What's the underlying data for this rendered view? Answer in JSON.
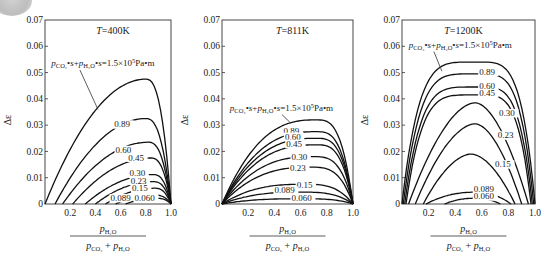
{
  "chart_data": [
    {
      "type": "line",
      "title": "T=400K",
      "xlabel": "p_H2O / (p_CO2 + p_H2O)",
      "ylabel": "Δε",
      "xlim": [
        0,
        1.0
      ],
      "ylim": [
        0,
        0.07
      ],
      "xticks": [
        "0.2",
        "0.4",
        "0.6",
        "0.8",
        "1.0"
      ],
      "yticks": [
        "0",
        "0.01",
        "0.02",
        "0.03",
        "0.04",
        "0.05",
        "0.06",
        "0.07"
      ],
      "annotation": "p_CO2·s + p_H2O·s = 1.5×10^5 Pa·m",
      "annotation_anchor": [
        0.42,
        0.036
      ],
      "annotation_text_pos": [
        0.05,
        0.0525
      ],
      "series": [
        {
          "name": "1.5",
          "label": "",
          "x0": 0.0,
          "xpk": 0.8,
          "ypk": 0.0475,
          "shape": "skew"
        },
        {
          "name": "0.89",
          "label": "0.89",
          "x0": 0.08,
          "xpk": 0.8,
          "ypk": 0.0325,
          "shape": "skew",
          "lx": 0.55,
          "ly": 0.0292
        },
        {
          "name": "0.60",
          "label": "0.60",
          "x0": 0.14,
          "xpk": 0.82,
          "ypk": 0.0235,
          "shape": "skew",
          "lx": 0.56,
          "ly": 0.0195
        },
        {
          "name": "0.45",
          "label": "0.45",
          "x0": 0.22,
          "xpk": 0.84,
          "ypk": 0.0175,
          "shape": "skew",
          "lx": 0.66,
          "ly": 0.0165
        },
        {
          "name": "0.30",
          "label": "0.30",
          "x0": 0.32,
          "xpk": 0.86,
          "ypk": 0.0112,
          "shape": "skew",
          "lx": 0.67,
          "ly": 0.0105
        },
        {
          "name": "0.23",
          "label": "0.23",
          "x0": 0.4,
          "xpk": 0.86,
          "ypk": 0.0085,
          "shape": "skew",
          "lx": 0.68,
          "ly": 0.0076
        },
        {
          "name": "0.15",
          "label": "0.15",
          "x0": 0.48,
          "xpk": 0.87,
          "ypk": 0.006,
          "shape": "skew",
          "lx": 0.69,
          "ly": 0.0048
        },
        {
          "name": "0.089",
          "label": "0.089",
          "x0": 0.56,
          "xpk": 0.87,
          "ypk": 0.0034,
          "shape": "skew",
          "lx": 0.52,
          "ly": 0.0012
        },
        {
          "name": "0.060",
          "label": "0.060",
          "x0": 0.64,
          "xpk": 0.88,
          "ypk": 0.0022,
          "shape": "skew",
          "lx": 0.71,
          "ly": 0.0012
        }
      ]
    },
    {
      "type": "line",
      "title": "T=811K",
      "xlabel": "p_H2O / (p_CO2 + p_H2O)",
      "ylabel": "Δε",
      "xlim": [
        0,
        1.0
      ],
      "ylim": [
        0,
        0.07
      ],
      "xticks": [
        "0.2",
        "0.4",
        "0.6",
        "0.8",
        "1.0"
      ],
      "yticks": [
        "0",
        "0.01",
        "0.02",
        "0.03",
        "0.04",
        "0.05",
        "0.06",
        "0.07"
      ],
      "annotation": "p_CO2·s + p_H2O·s = 1.5×10^5 Pa·m",
      "annotation_anchor": [
        0.52,
        0.031
      ],
      "annotation_text_pos": [
        0.06,
        0.0355
      ],
      "series": [
        {
          "name": "1.5",
          "label": "",
          "x0": 0.0,
          "xpk": 0.72,
          "ypk": 0.032,
          "shape": "flat"
        },
        {
          "name": "0.89",
          "label": "0.89",
          "x0": 0.0,
          "xpk": 0.72,
          "ypk": 0.0275,
          "shape": "flat",
          "lx": 0.47,
          "ly": 0.0268
        },
        {
          "name": "0.60",
          "label": "0.60",
          "x0": 0.0,
          "xpk": 0.72,
          "ypk": 0.025,
          "shape": "flat",
          "lx": 0.48,
          "ly": 0.0245
        },
        {
          "name": "0.45",
          "label": "0.45",
          "x0": 0.0,
          "xpk": 0.72,
          "ypk": 0.0225,
          "shape": "flat",
          "lx": 0.49,
          "ly": 0.0218
        },
        {
          "name": "0.30",
          "label": "0.30",
          "x0": 0.0,
          "xpk": 0.7,
          "ypk": 0.018,
          "shape": "flat",
          "lx": 0.53,
          "ly": 0.0168
        },
        {
          "name": "0.23",
          "label": "0.23",
          "x0": 0.0,
          "xpk": 0.68,
          "ypk": 0.014,
          "shape": "flat",
          "lx": 0.52,
          "ly": 0.0126
        },
        {
          "name": "0.15",
          "label": "0.15",
          "x0": 0.0,
          "xpk": 0.62,
          "ypk": 0.0075,
          "shape": "flat",
          "lx": 0.57,
          "ly": 0.0062
        },
        {
          "name": "0.089",
          "label": "0.089",
          "x0": 0.0,
          "xpk": 0.6,
          "ypk": 0.0045,
          "shape": "flat",
          "lx": 0.4,
          "ly": 0.004
        },
        {
          "name": "0.060",
          "label": "0.060",
          "x0": 0.0,
          "xpk": 0.6,
          "ypk": 0.002,
          "shape": "flat",
          "lx": 0.53,
          "ly": 0.0012
        }
      ]
    },
    {
      "type": "line",
      "title": "T=1200K",
      "xlabel": "p_H2O / (p_CO2 + p_H2O)",
      "ylabel": "Δε",
      "xlim": [
        0,
        1.0
      ],
      "ylim": [
        0,
        0.07
      ],
      "xticks": [
        "0.2",
        "0.4",
        "0.6",
        "0.8",
        "1.0"
      ],
      "yticks": [
        "0",
        "0.01",
        "0.02",
        "0.03",
        "0.04",
        "0.05",
        "0.06",
        "0.07"
      ],
      "annotation": "p_CO2·s + p_H2O·s = 1.5×10^5 Pa·m",
      "annotation_anchor": [
        0.3,
        0.0505
      ],
      "annotation_text_pos": [
        0.05,
        0.0595
      ],
      "series": [
        {
          "name": "1.5",
          "label": "",
          "x0": 0.0,
          "x1": 1.0,
          "xpk": 0.55,
          "ypk": 0.054,
          "shape": "dome"
        },
        {
          "name": "0.89",
          "label": "0.89",
          "x0": 0.01,
          "x1": 0.99,
          "xpk": 0.55,
          "ypk": 0.0495,
          "shape": "dome",
          "lx": 0.58,
          "ly": 0.0492
        },
        {
          "name": "0.60",
          "label": "0.60",
          "x0": 0.02,
          "x1": 0.98,
          "xpk": 0.55,
          "ypk": 0.0445,
          "shape": "dome",
          "lx": 0.58,
          "ly": 0.0438
        },
        {
          "name": "0.45",
          "label": "0.45",
          "x0": 0.03,
          "x1": 0.97,
          "xpk": 0.55,
          "ypk": 0.0415,
          "shape": "dome",
          "lx": 0.58,
          "ly": 0.041
        },
        {
          "name": "0.30",
          "label": "0.30",
          "x0": 0.05,
          "x1": 0.95,
          "xpk": 0.55,
          "ypk": 0.0385,
          "shape": "peak",
          "lx": 0.73,
          "ly": 0.0335
        },
        {
          "name": "0.23",
          "label": "0.23",
          "x0": 0.1,
          "x1": 0.9,
          "xpk": 0.55,
          "ypk": 0.0305,
          "shape": "peak",
          "lx": 0.72,
          "ly": 0.025
        },
        {
          "name": "0.15",
          "label": "0.15",
          "x0": 0.16,
          "x1": 0.85,
          "xpk": 0.52,
          "ypk": 0.019,
          "shape": "peak",
          "lx": 0.7,
          "ly": 0.014
        },
        {
          "name": "0.089",
          "label": "0.089",
          "x0": 0.18,
          "x1": 0.82,
          "xpk": 0.55,
          "ypk": 0.0045,
          "shape": "low",
          "lx": 0.54,
          "ly": 0.0044
        },
        {
          "name": "0.060",
          "label": "0.060",
          "x0": 0.32,
          "x1": 0.74,
          "xpk": 0.55,
          "ypk": 0.0022,
          "shape": "low",
          "lx": 0.54,
          "ly": 0.0018
        }
      ]
    }
  ],
  "panels": [
    {
      "title_T": "T",
      "title_val": "=400K"
    },
    {
      "title_T": "T",
      "title_val": "=811K"
    },
    {
      "title_T": "T",
      "title_val": "=1200K"
    }
  ]
}
